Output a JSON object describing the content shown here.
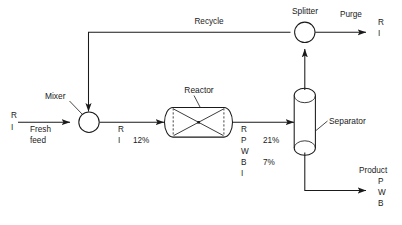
{
  "diagram": {
    "type": "process-flow-diagram",
    "canvas": {
      "width": 402,
      "height": 225
    },
    "line_color": "#1a1a1a",
    "background_color": "#ffffff"
  },
  "equipment": {
    "mixer": {
      "label": "Mixer",
      "shape": "circle"
    },
    "reactor": {
      "label": "Reactor",
      "shape": "horizontal-vessel"
    },
    "separator": {
      "label": "Separator",
      "shape": "vertical-vessel"
    },
    "splitter": {
      "label": "Splitter",
      "shape": "circle"
    }
  },
  "streams": {
    "fresh_feed": {
      "name": "Fresh feed",
      "name_line1": "Fresh",
      "name_line2": "feed",
      "components": [
        "R",
        "I"
      ]
    },
    "recycle": {
      "name": "Recycle"
    },
    "mixer_outlet": {
      "components": [
        "R",
        "I"
      ],
      "conversion": "12%"
    },
    "reactor_outlet": {
      "components": [
        "R",
        "P",
        "W",
        "B",
        "I"
      ],
      "values": [
        "21%",
        "7%"
      ]
    },
    "purge": {
      "name": "Purge",
      "components": [
        "R",
        "I"
      ]
    },
    "product": {
      "name": "Product",
      "components": [
        "P",
        "W",
        "B"
      ]
    }
  },
  "caption": {
    "text": ""
  }
}
